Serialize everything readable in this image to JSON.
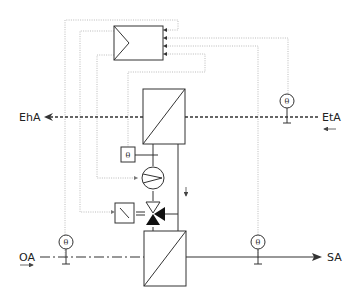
{
  "diagram": {
    "type": "HVAC run-around coil heat recovery schematic",
    "labels": {
      "exhaust_air": "EhA",
      "extract_air": "EtA",
      "outdoor_air": "OA",
      "supply_air": "SA"
    },
    "sensor_symbol": "θ",
    "components": [
      {
        "id": "controller",
        "name": "Controller"
      },
      {
        "id": "hx-extract",
        "name": "Extract air heat exchanger coil"
      },
      {
        "id": "hx-supply",
        "name": "Supply air heat exchanger coil"
      },
      {
        "id": "pump",
        "name": "Circulation pump"
      },
      {
        "id": "three-way-valve",
        "name": "Three-way mixing valve"
      },
      {
        "id": "valve-actuator",
        "name": "Valve actuator"
      },
      {
        "id": "sensor-extract",
        "name": "Extract air temperature sensor"
      },
      {
        "id": "sensor-outdoor",
        "name": "Outdoor air temperature sensor"
      },
      {
        "id": "sensor-supply",
        "name": "Supply air temperature sensor"
      },
      {
        "id": "sensor-water",
        "name": "Water temperature sensor"
      }
    ],
    "colors": {
      "line": "#333333",
      "control_line": "#a9a9a9",
      "background": "#ffffff"
    }
  }
}
